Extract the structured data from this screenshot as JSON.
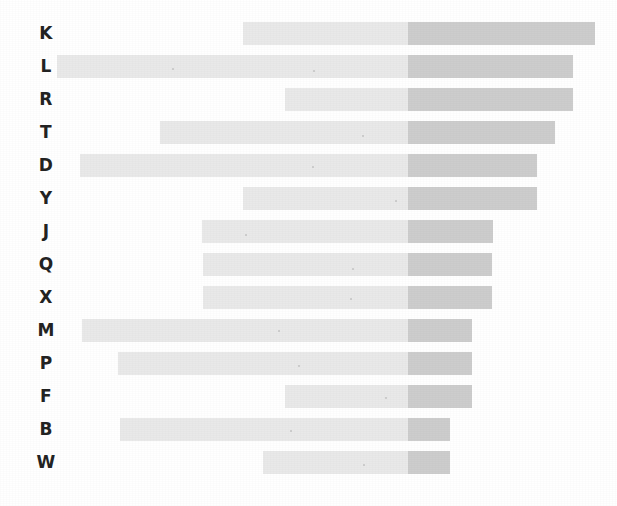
{
  "chart_data": {
    "type": "bar",
    "subtype": "horizontal-range-bar",
    "title": "",
    "subtitle": "",
    "xlabel": "",
    "ylabel": "",
    "grid": false,
    "legend": null,
    "xlim": [
      0,
      617
    ],
    "axis_visible": false,
    "tick_labels_x": [],
    "orientation": "horizontal",
    "value_unit": "pixels",
    "split_x": 408,
    "colors": {
      "segment_light": "#e9e9e9",
      "segment_dark": "#cdcdcd",
      "label_text": "#232323",
      "background": "#ffffff"
    },
    "categories": [
      "K",
      "L",
      "R",
      "T",
      "D",
      "Y",
      "J",
      "Q",
      "X",
      "M",
      "P",
      "F",
      "B",
      "W"
    ],
    "series": [
      {
        "name": "light-segment",
        "color": "#e9e9e9",
        "values": [
          165,
          351,
          123,
          248,
          328,
          165,
          206,
          205,
          205,
          326,
          290,
          123,
          288,
          145
        ]
      },
      {
        "name": "dark-segment",
        "color": "#cdcdcd",
        "values": [
          187,
          165,
          165,
          147,
          129,
          129,
          85,
          84,
          84,
          64,
          64,
          64,
          42,
          42
        ]
      }
    ],
    "rows": [
      {
        "label": "K",
        "start": 243,
        "split": 408,
        "end": 595,
        "y": 22,
        "height": 23,
        "light_width": 165,
        "dark_width": 187,
        "total_width": 352
      },
      {
        "label": "L",
        "start": 57,
        "split": 408,
        "end": 573,
        "y": 55,
        "height": 23,
        "light_width": 351,
        "dark_width": 165,
        "total_width": 516
      },
      {
        "label": "R",
        "start": 285,
        "split": 408,
        "end": 573,
        "y": 88,
        "height": 23,
        "light_width": 123,
        "dark_width": 165,
        "total_width": 288
      },
      {
        "label": "T",
        "start": 160,
        "split": 408,
        "end": 555,
        "y": 121,
        "height": 23,
        "light_width": 248,
        "dark_width": 147,
        "total_width": 395
      },
      {
        "label": "D",
        "start": 80,
        "split": 408,
        "end": 537,
        "y": 154,
        "height": 23,
        "light_width": 328,
        "dark_width": 129,
        "total_width": 457
      },
      {
        "label": "Y",
        "start": 243,
        "split": 408,
        "end": 537,
        "y": 187,
        "height": 23,
        "light_width": 165,
        "dark_width": 129,
        "total_width": 294
      },
      {
        "label": "J",
        "start": 202,
        "split": 408,
        "end": 493,
        "y": 220,
        "height": 23,
        "light_width": 206,
        "dark_width": 85,
        "total_width": 291
      },
      {
        "label": "Q",
        "start": 203,
        "split": 408,
        "end": 492,
        "y": 253,
        "height": 23,
        "light_width": 205,
        "dark_width": 84,
        "total_width": 289
      },
      {
        "label": "X",
        "start": 203,
        "split": 408,
        "end": 492,
        "y": 286,
        "height": 23,
        "light_width": 205,
        "dark_width": 84,
        "total_width": 289
      },
      {
        "label": "M",
        "start": 82,
        "split": 408,
        "end": 472,
        "y": 319,
        "height": 23,
        "light_width": 326,
        "dark_width": 64,
        "total_width": 390
      },
      {
        "label": "P",
        "start": 118,
        "split": 408,
        "end": 472,
        "y": 352,
        "height": 23,
        "light_width": 290,
        "dark_width": 64,
        "total_width": 354
      },
      {
        "label": "F",
        "start": 285,
        "split": 408,
        "end": 472,
        "y": 385,
        "height": 23,
        "light_width": 123,
        "dark_width": 64,
        "total_width": 187
      },
      {
        "label": "B",
        "start": 120,
        "split": 408,
        "end": 450,
        "y": 418,
        "height": 23,
        "light_width": 288,
        "dark_width": 42,
        "total_width": 330
      },
      {
        "label": "W",
        "start": 263,
        "split": 408,
        "end": 450,
        "y": 451,
        "height": 23,
        "light_width": 145,
        "dark_width": 42,
        "total_width": 187
      }
    ],
    "label_column_x": 24,
    "specks": [
      {
        "x": 172,
        "y": 68
      },
      {
        "x": 313,
        "y": 70
      },
      {
        "x": 362,
        "y": 135
      },
      {
        "x": 312,
        "y": 166
      },
      {
        "x": 395,
        "y": 200
      },
      {
        "x": 245,
        "y": 234
      },
      {
        "x": 352,
        "y": 268
      },
      {
        "x": 350,
        "y": 298
      },
      {
        "x": 278,
        "y": 330
      },
      {
        "x": 298,
        "y": 365
      },
      {
        "x": 385,
        "y": 397
      },
      {
        "x": 290,
        "y": 430
      },
      {
        "x": 363,
        "y": 464
      }
    ]
  }
}
